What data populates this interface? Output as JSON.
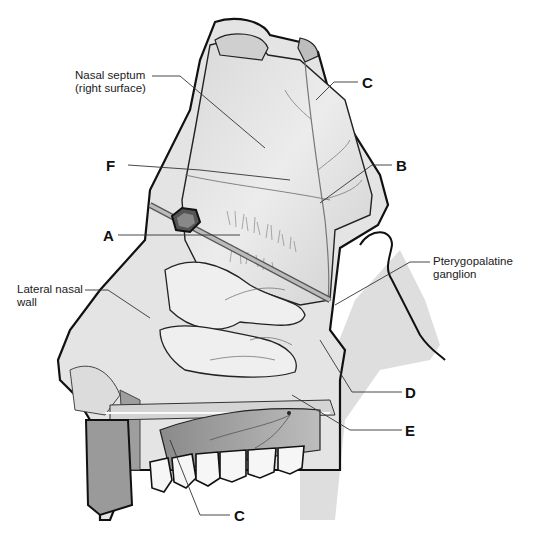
{
  "diagram": {
    "labels": {
      "nasal_septum": "Nasal septum\n(right surface)",
      "lateral_wall": "Lateral nasal\nwall",
      "pterygopalatine": "Pterygopalatine\nganglion",
      "A": "A",
      "B": "B",
      "C_top": "C",
      "C_bottom": "C",
      "D": "D",
      "E": "E",
      "F": "F"
    },
    "colors": {
      "outline": "#111111",
      "tissue_light": "#e6e6e6",
      "tissue_mid": "#c8c8c8",
      "tissue_dark": "#9a9a9a",
      "leader": "#333333",
      "background": "#ffffff"
    }
  }
}
